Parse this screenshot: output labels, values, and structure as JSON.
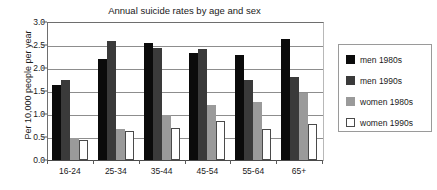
{
  "chart_data": {
    "type": "bar",
    "title": "Annual suicide rates by age and sex",
    "xlabel": "",
    "ylabel": "Per 10,000 people per year",
    "categories": [
      "16-24",
      "25-34",
      "35-44",
      "45-54",
      "55-64",
      "65+"
    ],
    "series": [
      {
        "name": "men 1980s",
        "color": "#0b0b0b",
        "values": [
          1.63,
          2.19,
          2.55,
          2.33,
          2.28,
          2.62
        ]
      },
      {
        "name": "men 1990s",
        "color": "#3a3a3a",
        "values": [
          1.75,
          2.58,
          2.44,
          2.42,
          1.73,
          1.81
        ]
      },
      {
        "name": "women 1980s",
        "color": "#9a9a9a",
        "values": [
          0.48,
          0.67,
          0.98,
          1.2,
          1.27,
          1.46
        ]
      },
      {
        "name": "women 1990s",
        "color": "#ffffff",
        "values": [
          0.44,
          0.64,
          0.7,
          0.85,
          0.68,
          0.78
        ]
      }
    ],
    "ylim": [
      0.0,
      3.0
    ],
    "yticks": [
      "0.0",
      "0.5",
      "1.0",
      "1.5",
      "2.0",
      "2.5",
      "3.0"
    ],
    "ytick_values": [
      0.0,
      0.5,
      1.0,
      1.5,
      2.0,
      2.5,
      3.0
    ],
    "grid": true,
    "legend_position": "right"
  }
}
